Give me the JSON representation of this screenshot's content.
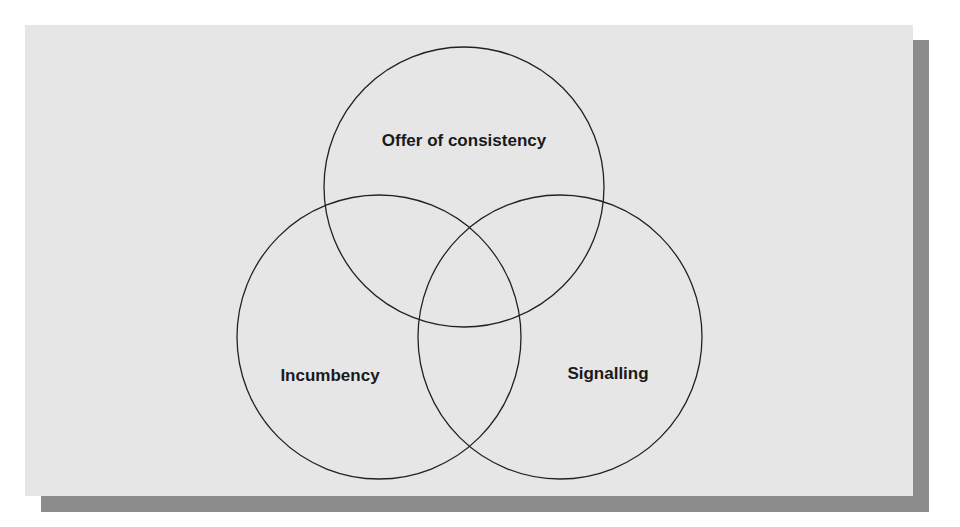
{
  "diagram": {
    "type": "venn",
    "circles": [
      {
        "id": "top",
        "label": "Offer of consistency",
        "cx": 464,
        "cy": 187,
        "r": 140,
        "label_x": 464,
        "label_y": 146
      },
      {
        "id": "left",
        "label": "Incumbency",
        "cx": 379,
        "cy": 337,
        "r": 142,
        "label_x": 330,
        "label_y": 381
      },
      {
        "id": "right",
        "label": "Signalling",
        "cx": 560,
        "cy": 337,
        "r": 142,
        "label_x": 608,
        "label_y": 379
      }
    ],
    "colors": {
      "panel": "#e6e6e6",
      "shadow": "#8c8c8c",
      "stroke": "#222222",
      "text": "#1a1a1a"
    }
  }
}
